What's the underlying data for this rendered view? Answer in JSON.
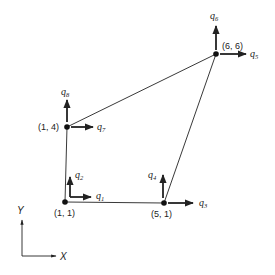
{
  "diagram": {
    "type": "quadrilateral finite element with nodal degrees of freedom",
    "colors": {
      "stroke": "#222222",
      "background": "#ffffff"
    },
    "nodes": [
      {
        "id": "n1",
        "label": "(1, 1)",
        "px": [
          65,
          202
        ],
        "dofs": [
          "q1",
          "q2"
        ]
      },
      {
        "id": "n2",
        "label": "(5, 1)",
        "px": [
          164,
          203
        ],
        "dofs": [
          "q3",
          "q4"
        ]
      },
      {
        "id": "n3",
        "label": "(6, 6)",
        "px": [
          216,
          54
        ],
        "dofs": [
          "q5",
          "q6"
        ]
      },
      {
        "id": "n4",
        "label": "(1, 4)",
        "px": [
          67,
          127
        ],
        "dofs": [
          "q7",
          "q8"
        ]
      }
    ],
    "dof_labels": {
      "q1": {
        "base": "q",
        "sub": "1"
      },
      "q2": {
        "base": "q",
        "sub": "2"
      },
      "q3": {
        "base": "q",
        "sub": "3"
      },
      "q4": {
        "base": "q",
        "sub": "4"
      },
      "q5": {
        "base": "q",
        "sub": "5"
      },
      "q6": {
        "base": "q",
        "sub": "6"
      },
      "q7": {
        "base": "q",
        "sub": "7"
      },
      "q8": {
        "base": "q",
        "sub": "8"
      }
    },
    "axes": {
      "x_label": "X",
      "y_label": "Y"
    }
  }
}
